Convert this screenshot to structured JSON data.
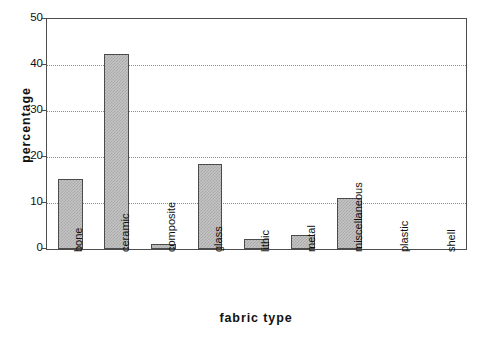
{
  "chart_data": {
    "type": "bar",
    "title": "",
    "xlabel": "fabric type",
    "ylabel": "percentage",
    "categories": [
      "bone",
      "ceramic",
      "composite",
      "glass",
      "lithic",
      "metal",
      "miscellaneous",
      "plastic",
      "shell"
    ],
    "values": [
      15.3,
      42.5,
      1.1,
      18.5,
      2.2,
      3.1,
      11.1,
      0,
      0
    ],
    "ylim": [
      0,
      50
    ],
    "yticks": [
      0,
      10,
      20,
      30,
      40,
      50
    ],
    "ytick_labels": [
      "0",
      "10",
      "20",
      "30",
      "40",
      "50"
    ],
    "grid": true,
    "grid_axis": "y",
    "legend": "none",
    "bar_fill_color": "#c4c4c4",
    "bar_edge_color": "#4b4b4b",
    "axis_color": "#4d4d4d",
    "background_color": "#ffffff"
  }
}
